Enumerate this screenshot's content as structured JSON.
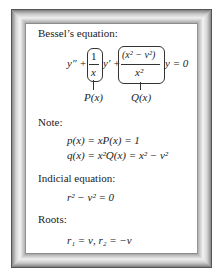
{
  "sections": {
    "bessel": {
      "heading": "Bessel’s equation:",
      "equation": {
        "y_double_prime": "y″ +",
        "p_numerator": "1",
        "p_denominator": "x",
        "y_prime": "y′ +",
        "q_numerator": "(x² − ν²)",
        "q_denominator": "x²",
        "rhs": "y = 0"
      },
      "labels": {
        "p": "P(x)",
        "q": "Q(x)"
      }
    },
    "note": {
      "heading": "Note:",
      "line1": "p(x) = xP(x) = 1",
      "line2": "q(x) = x²Q(x) = x² − ν²"
    },
    "indicial": {
      "heading": "Indicial equation:",
      "equation": "r² − ν² = 0"
    },
    "roots": {
      "heading": "Roots:",
      "equation": "r₁ = ν,  r₂ = −ν"
    }
  },
  "colors": {
    "frame_light": "#f2f2f2",
    "frame_dark": "#7d7d7d",
    "panel": "#ffffff",
    "text": "#222222"
  }
}
